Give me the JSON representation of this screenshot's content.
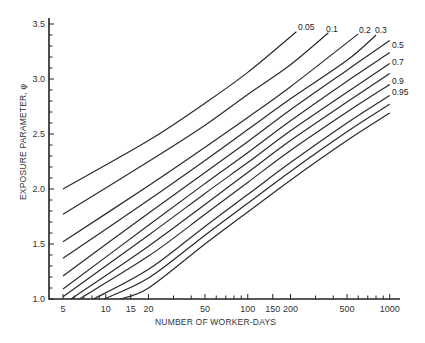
{
  "chart_data": {
    "type": "line",
    "title": "",
    "xlabel": "NUMBER OF WORKER-DAYS",
    "ylabel": "EXPOSURE PARAMETER, φ",
    "x_scale": "log",
    "xlim": [
      4,
      1100
    ],
    "ylim": [
      1.0,
      3.6
    ],
    "grid": false,
    "legend": "curve labels at right end",
    "x_ticks": [
      5,
      10,
      15,
      20,
      50,
      100,
      150,
      200,
      500,
      1000
    ],
    "x_tick_labels": [
      "5",
      "10",
      "15",
      "20",
      "50",
      "100",
      "150",
      "200",
      "500",
      "1000"
    ],
    "x_minor_ticks": [
      6,
      7,
      8,
      9,
      30,
      40,
      60,
      70,
      80,
      90,
      300,
      400,
      600,
      700,
      800,
      900
    ],
    "y_ticks": [
      1.0,
      1.5,
      2.0,
      2.5,
      3.0,
      3.5
    ],
    "y_tick_labels": [
      "1.0",
      "1.5",
      "2.0",
      "2.5",
      "3.0",
      "3.5"
    ],
    "y_minor_step": 0.1,
    "series": [
      {
        "name": "0.05",
        "label": "0.05",
        "points": [
          [
            5,
            2.0
          ],
          [
            20,
            2.44
          ],
          [
            50,
            2.78
          ],
          [
            100,
            3.06
          ],
          [
            220,
            3.43
          ]
        ]
      },
      {
        "name": "0.1",
        "label": "0.1",
        "points": [
          [
            5,
            1.77
          ],
          [
            20,
            2.25
          ],
          [
            50,
            2.58
          ],
          [
            100,
            2.86
          ],
          [
            200,
            3.13
          ],
          [
            370,
            3.42
          ]
        ]
      },
      {
        "name": "0.2",
        "label": "0.2",
        "points": [
          [
            5,
            1.52
          ],
          [
            20,
            2.03
          ],
          [
            50,
            2.38
          ],
          [
            100,
            2.65
          ],
          [
            200,
            2.93
          ],
          [
            600,
            3.41
          ]
        ]
      },
      {
        "name": "0.3",
        "label": "0.3",
        "points": [
          [
            5,
            1.37
          ],
          [
            20,
            1.9
          ],
          [
            50,
            2.26
          ],
          [
            100,
            2.54
          ],
          [
            200,
            2.82
          ],
          [
            500,
            3.17
          ],
          [
            800,
            3.4
          ]
        ]
      },
      {
        "name": "0.4",
        "label": "",
        "points": [
          [
            5,
            1.21
          ],
          [
            20,
            1.78
          ],
          [
            50,
            2.15
          ],
          [
            100,
            2.43
          ],
          [
            200,
            2.72
          ],
          [
            500,
            3.08
          ],
          [
            1000,
            3.35
          ]
        ]
      },
      {
        "name": "0.5",
        "label": "0.5",
        "points": [
          [
            5,
            1.09
          ],
          [
            20,
            1.67
          ],
          [
            50,
            2.05
          ],
          [
            100,
            2.33
          ],
          [
            200,
            2.62
          ],
          [
            500,
            2.98
          ],
          [
            1000,
            3.24
          ]
        ]
      },
      {
        "name": "0.6",
        "label": "",
        "points": [
          [
            5,
            1.02
          ],
          [
            20,
            1.58
          ],
          [
            50,
            1.96
          ],
          [
            100,
            2.24
          ],
          [
            200,
            2.53
          ],
          [
            500,
            2.88
          ],
          [
            1000,
            3.14
          ]
        ]
      },
      {
        "name": "0.7",
        "label": "0.7",
        "points": [
          [
            5.7,
            1.0
          ],
          [
            20,
            1.48
          ],
          [
            50,
            1.86
          ],
          [
            100,
            2.15
          ],
          [
            200,
            2.44
          ],
          [
            500,
            2.79
          ],
          [
            1000,
            3.05
          ]
        ]
      },
      {
        "name": "0.8",
        "label": "",
        "points": [
          [
            6.5,
            1.0
          ],
          [
            20,
            1.39
          ],
          [
            50,
            1.77
          ],
          [
            100,
            2.06
          ],
          [
            200,
            2.35
          ],
          [
            500,
            2.7
          ],
          [
            1000,
            2.95
          ]
        ]
      },
      {
        "name": "0.9",
        "label": "0.9",
        "points": [
          [
            8.2,
            1.0
          ],
          [
            20,
            1.27
          ],
          [
            50,
            1.66
          ],
          [
            100,
            1.95
          ],
          [
            200,
            2.24
          ],
          [
            500,
            2.6
          ],
          [
            1000,
            2.85
          ]
        ]
      },
      {
        "name": "0.95",
        "label": "0.95",
        "points": [
          [
            9.7,
            1.0
          ],
          [
            20,
            1.19
          ],
          [
            50,
            1.58
          ],
          [
            100,
            1.87
          ],
          [
            200,
            2.16
          ],
          [
            500,
            2.52
          ],
          [
            1000,
            2.77
          ]
        ]
      },
      {
        "name": "extra",
        "label": "",
        "points": [
          [
            12.6,
            1.0
          ],
          [
            20,
            1.1
          ],
          [
            50,
            1.5
          ],
          [
            100,
            1.79
          ],
          [
            200,
            2.08
          ],
          [
            500,
            2.44
          ],
          [
            1000,
            2.69
          ]
        ]
      }
    ],
    "label_positions": [
      {
        "text": "0.05",
        "x": 298,
        "y": 30
      },
      {
        "text": "0.1",
        "x": 326,
        "y": 32
      },
      {
        "text": "0.2",
        "x": 359,
        "y": 33
      },
      {
        "text": "0.3",
        "x": 375,
        "y": 33
      },
      {
        "text": "0.5",
        "x": 392,
        "y": 48
      },
      {
        "text": "0.7",
        "x": 392,
        "y": 65
      },
      {
        "text": "0.9",
        "x": 392,
        "y": 84
      },
      {
        "text": "0.95",
        "x": 392,
        "y": 95
      }
    ]
  },
  "layout": {
    "x_origin_px": 63,
    "x_px_per_decade": 142,
    "x_ref_value": 5,
    "y_base_px": 299,
    "y_px_per_unit": 110,
    "axis_left_px": 49,
    "axis_right_px": 400,
    "axis_top_px": 18
  }
}
